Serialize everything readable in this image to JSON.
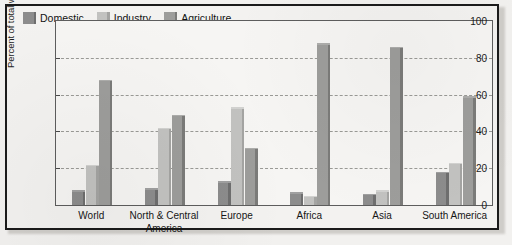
{
  "chart_data": {
    "type": "bar",
    "title": "",
    "xlabel": "",
    "ylabel": "Percent of total withdrawals",
    "ylim": [
      0,
      100
    ],
    "yticks": [
      0,
      20,
      40,
      60,
      80,
      100
    ],
    "grid": true,
    "legend_position": "top-left",
    "categories": [
      "World",
      "North & Central\nAmerica",
      "Europe",
      "Africa",
      "Asia",
      "South America"
    ],
    "series": [
      {
        "name": "Domestic",
        "color": "#8c8c8c",
        "values": [
          8,
          9,
          13,
          7,
          6,
          18
        ]
      },
      {
        "name": "Industry",
        "color": "#c2c2c0",
        "values": [
          22,
          42,
          53,
          5,
          8,
          23
        ]
      },
      {
        "name": "Agriculture",
        "color": "#9d9d9b",
        "values": [
          68,
          49,
          31,
          88,
          86,
          59
        ]
      }
    ]
  }
}
